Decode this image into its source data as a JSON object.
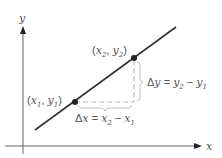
{
  "diagram": {
    "type": "slope-of-line",
    "axes": {
      "x_label": "x",
      "y_label": "y"
    },
    "points": [
      {
        "id": "p1",
        "label": "(x1, y1)",
        "var_x": "x",
        "sub_x": "1",
        "var_y": "y",
        "sub_y": "1"
      },
      {
        "id": "p2",
        "label": "(x2, y2)",
        "var_x": "x",
        "sub_x": "2",
        "var_y": "y",
        "sub_y": "2"
      }
    ],
    "delta_x": {
      "text": "Δx = x2 − x1",
      "delta": "Δ",
      "var": "x",
      "eq": " = ",
      "a": "x",
      "a_sub": "2",
      "minus": " − ",
      "b": "x",
      "b_sub": "1"
    },
    "delta_y": {
      "text": "Δy = y2 − y1",
      "delta": "Δ",
      "var": "y",
      "eq": " = ",
      "a": "y",
      "a_sub": "2",
      "minus": " − ",
      "b": "y",
      "b_sub": "1"
    },
    "colors": {
      "line": "#333333",
      "axis": "#555555",
      "dashed": "#bbbbbb",
      "text": "#555555",
      "point": "#222222"
    }
  }
}
